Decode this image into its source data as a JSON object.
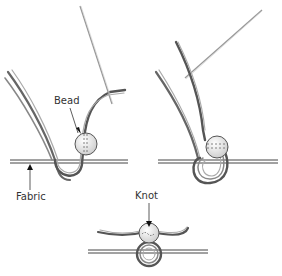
{
  "diagram": {
    "panels": [
      {
        "id": "step-1",
        "labels": [
          "Bead",
          "Fabric"
        ]
      },
      {
        "id": "step-2",
        "labels": []
      },
      {
        "id": "step-3",
        "labels": [
          "Knot"
        ]
      }
    ],
    "labels": {
      "bead": "Bead",
      "fabric": "Fabric",
      "knot": "Knot"
    },
    "colors": {
      "thread_dark": "#555555",
      "thread_light": "#aaaaaa",
      "bead_fill": "#ececec",
      "fabric_line": "#444444",
      "needle": "#999999"
    }
  }
}
